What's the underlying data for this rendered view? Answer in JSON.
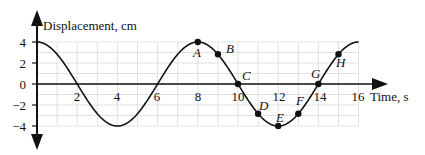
{
  "chart_data": {
    "type": "line",
    "title": "",
    "xlabel": "Time, s",
    "ylabel": "Displacement, cm",
    "xlim": [
      0,
      16
    ],
    "ylim": [
      -4,
      4
    ],
    "x_ticks": [
      2,
      4,
      6,
      8,
      10,
      12,
      14,
      16
    ],
    "y_ticks": [
      4,
      2,
      0,
      -2,
      -4
    ],
    "grid": true,
    "function": "y = 4*cos(pi*t/4)",
    "amplitude_cm": 4,
    "period_s": 8,
    "series": [
      {
        "name": "Displacement",
        "x": [
          0,
          1,
          2,
          3,
          4,
          5,
          6,
          7,
          8,
          9,
          10,
          11,
          12,
          13,
          14,
          15,
          16
        ],
        "values": [
          4,
          2.83,
          0,
          -2.83,
          -4,
          -2.83,
          0,
          2.83,
          4,
          2.83,
          0,
          -2.83,
          -4,
          -2.83,
          0,
          2.83,
          4
        ]
      }
    ],
    "points": [
      {
        "label": "A",
        "x": 8,
        "y": 4
      },
      {
        "label": "B",
        "x": 9,
        "y": 2.83
      },
      {
        "label": "C",
        "x": 10,
        "y": 0
      },
      {
        "label": "D",
        "x": 11,
        "y": -2.83
      },
      {
        "label": "E",
        "x": 12,
        "y": -4
      },
      {
        "label": "F",
        "x": 13,
        "y": -2.83
      },
      {
        "label": "G",
        "x": 14,
        "y": 0
      },
      {
        "label": "H",
        "x": 15,
        "y": 2.83
      }
    ]
  },
  "labels": {
    "ylabel": "Displacement, cm",
    "xlabel": "Time, s",
    "y4": "4",
    "y2": "2",
    "y0": "0",
    "ym2": "−2",
    "ym4": "−4",
    "x2": "2",
    "x4": "4",
    "x6": "6",
    "x8": "8",
    "x10": "10",
    "x12": "12",
    "x14": "14",
    "x16": "16",
    "A": "A",
    "B": "B",
    "C": "C",
    "D": "D",
    "E": "E",
    "F": "F",
    "G": "G",
    "H": "H"
  },
  "colors": {
    "curve": "#111111",
    "grid": "#d9d9d9",
    "axis": "#111111"
  }
}
